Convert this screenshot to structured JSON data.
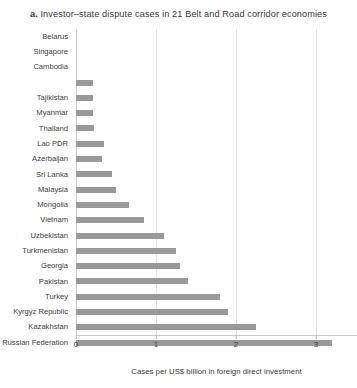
{
  "chart_data": {
    "type": "bar",
    "orientation": "horizontal",
    "title": "a. Investor–state dispute cases in 21 Belt and Road corridor economies",
    "title_prefix": "a.",
    "title_rest": " Investor–state dispute cases in 21 Belt and Road corridor economies",
    "xlabel": "Cases per US$ billion in foreign direct investment",
    "ylabel": "",
    "xlim": [
      0,
      3.5
    ],
    "xticks": [
      0,
      1,
      2,
      3
    ],
    "xtick_labels": [
      "0",
      "1",
      "2",
      "3"
    ],
    "grid": "vertical",
    "legend": "none",
    "bar_color": "#999999",
    "categories": [
      "Belarus",
      "Singapore",
      "Cambodia",
      "",
      "Tajikistan",
      "Myanmar",
      "Thailand",
      "Lao PDR",
      "Azerbaijan",
      "Sri Lanka",
      "Malaysia",
      "Mongolia",
      "Vietnam",
      "Uzbekistan",
      "Turkmenistan",
      "Georgia",
      "Pakistan",
      "Turkey",
      "Kyrgyz Republic",
      "Kazakhstan",
      "Russian Federation"
    ],
    "values": [
      0,
      0,
      0,
      0.21,
      0.21,
      0.21,
      0.22,
      0.35,
      0.33,
      0.45,
      0.5,
      0.66,
      0.85,
      1.1,
      1.25,
      1.3,
      1.4,
      1.8,
      1.9,
      2.25,
      3.2
    ]
  }
}
